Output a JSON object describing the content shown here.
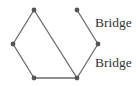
{
  "diagram": {
    "type": "graph",
    "nodes": [
      {
        "id": "A",
        "x": 34,
        "y": 10
      },
      {
        "id": "B",
        "x": 13,
        "y": 44
      },
      {
        "id": "C",
        "x": 34,
        "y": 78
      },
      {
        "id": "D",
        "x": 77,
        "y": 78
      },
      {
        "id": "E",
        "x": 98,
        "y": 44
      },
      {
        "id": "F",
        "x": 77,
        "y": 10
      }
    ],
    "edges": [
      {
        "from": "A",
        "to": "B"
      },
      {
        "from": "B",
        "to": "C"
      },
      {
        "from": "C",
        "to": "D"
      },
      {
        "from": "A",
        "to": "D"
      },
      {
        "from": "D",
        "to": "E"
      },
      {
        "from": "E",
        "to": "F"
      }
    ],
    "labels": [
      {
        "text": "Bridge",
        "x": 95,
        "y": 27,
        "edge": "E-F"
      },
      {
        "text": "Bridge",
        "x": 95,
        "y": 67,
        "edge": "D-E"
      }
    ],
    "colors": {
      "edge": "#6a6a6a",
      "node": "#555555",
      "text": "#333333"
    }
  }
}
